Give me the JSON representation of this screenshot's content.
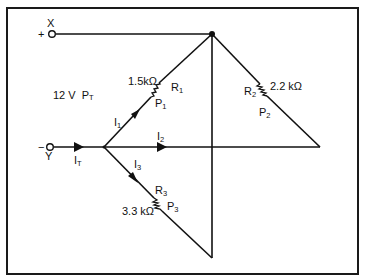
{
  "diagram": {
    "type": "parallel-circuit",
    "terminals": {
      "positive": {
        "sign": "+",
        "name": "X"
      },
      "negative": {
        "sign": "−",
        "name": "Y"
      }
    },
    "source": {
      "voltage": "12 V",
      "power_label": "P",
      "power_sub": "T"
    },
    "currents": {
      "total": {
        "label": "I",
        "sub": "T"
      },
      "i1": {
        "label": "I",
        "sub": "1"
      },
      "i2": {
        "label": "I",
        "sub": "2"
      },
      "i3": {
        "label": "I",
        "sub": "3"
      }
    },
    "resistors": [
      {
        "name": "R",
        "sub": "1",
        "value": "1.5kΩ",
        "power": "P",
        "power_sub": "1"
      },
      {
        "name": "R",
        "sub": "2",
        "value": "2.2 kΩ",
        "power": "P",
        "power_sub": "2"
      },
      {
        "name": "R",
        "sub": "3",
        "value": "3.3 kΩ",
        "power": "P",
        "power_sub": "3"
      }
    ]
  }
}
